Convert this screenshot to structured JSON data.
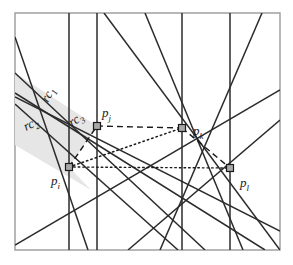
{
  "figure": {
    "name": "line-arrangement-diagram",
    "background_color": "#ffffff",
    "frame": {
      "name": "plot-frame",
      "x": 15,
      "y": 13,
      "width": 265,
      "height": 237,
      "stroke_color": "#9a9a9a",
      "fill_color": "#ffffff"
    },
    "shaded_region": {
      "name": "rc-wedge-shaded-area",
      "fill_color": "#e6e6e6",
      "stroke_color": "none"
    },
    "line_color": "#2b2b2b",
    "dashed_color": "#1a1a1a",
    "dotted_color": "#1a1a1a",
    "marker": {
      "fill_color": "#a8a8a8",
      "stroke_color": "#1a1a1a",
      "size": 7
    }
  },
  "points": [
    {
      "id": "p_i",
      "base": "p",
      "sub": "i",
      "x": 69,
      "y": 167,
      "label_dx": -18,
      "label_dy": 18
    },
    {
      "id": "p_j",
      "base": "p",
      "sub": "j",
      "x": 97,
      "y": 126,
      "label_dx": 5,
      "label_dy": -9
    },
    {
      "id": "p_k",
      "base": "p",
      "sub": "k",
      "x": 182,
      "y": 128,
      "label_dx": 11,
      "label_dy": 7
    },
    {
      "id": "p_l",
      "base": "p",
      "sub": "l",
      "x": 230,
      "y": 168,
      "label_dx": 10,
      "label_dy": 19
    }
  ],
  "region_labels": [
    {
      "id": "rc_1",
      "base": "rc",
      "sub": "1",
      "x": 48,
      "y": 103,
      "rotate": -62
    },
    {
      "id": "rc_2",
      "base": "rc",
      "sub": "2",
      "x": 26,
      "y": 131,
      "rotate": -26
    },
    {
      "id": "rc_3",
      "base": "rc",
      "sub": "3",
      "x": 72,
      "y": 127,
      "rotate": -34
    }
  ],
  "solid_lines": [
    {
      "name": "vertical-line-through-pi",
      "x1": 69,
      "y1": 13,
      "x2": 69,
      "y2": 250
    },
    {
      "name": "vertical-line-through-pj",
      "x1": 97,
      "y1": 13,
      "x2": 97,
      "y2": 250
    },
    {
      "name": "vertical-line-through-pk",
      "x1": 182,
      "y1": 13,
      "x2": 182,
      "y2": 250
    },
    {
      "name": "vertical-line-through-pl",
      "x1": 230,
      "y1": 13,
      "x2": 230,
      "y2": 250
    },
    {
      "name": "diagonal-upper-left-steep",
      "x1": 15,
      "y1": 37,
      "x2": 88,
      "y2": 250
    },
    {
      "name": "diagonal-upper-left-shallow-a",
      "x1": 15,
      "y1": 73,
      "x2": 205,
      "y2": 250
    },
    {
      "name": "diagonal-rc2-boundary",
      "x1": 15,
      "y1": 104,
      "x2": 178,
      "y2": 250
    },
    {
      "name": "diagonal-pi-to-upper-left",
      "x1": 15,
      "y1": 97,
      "x2": 280,
      "y2": 231
    },
    {
      "name": "diagonal-pj-descending",
      "x1": 15,
      "y1": 93,
      "x2": 265,
      "y2": 250
    },
    {
      "name": "diagonal-pk-steep-down",
      "x1": 145,
      "y1": 13,
      "x2": 243,
      "y2": 250
    },
    {
      "name": "diagonal-pi-pk-ascending",
      "x1": 15,
      "y1": 245,
      "x2": 280,
      "y2": 90
    },
    {
      "name": "diagonal-pl-ascending",
      "x1": 128,
      "y1": 250,
      "x2": 280,
      "y2": 120
    },
    {
      "name": "diagonal-pk-to-lower-left",
      "x1": 262,
      "y1": 13,
      "x2": 160,
      "y2": 250
    },
    {
      "name": "diagonal-long-descending",
      "x1": 104,
      "y1": 13,
      "x2": 280,
      "y2": 250
    }
  ],
  "dashed_lines": [
    {
      "name": "dashed-pi-pj",
      "from": "p_i",
      "to": "p_j"
    },
    {
      "name": "dashed-pj-pk",
      "from": "p_j",
      "to": "p_k"
    },
    {
      "name": "dashed-pk-pl",
      "from": "p_k",
      "to": "p_l"
    }
  ],
  "dotted_lines": [
    {
      "name": "dotted-pi-pk",
      "from": "p_i",
      "to": "p_k"
    },
    {
      "name": "dotted-pi-pl",
      "from": "p_i",
      "to": "p_l"
    }
  ]
}
